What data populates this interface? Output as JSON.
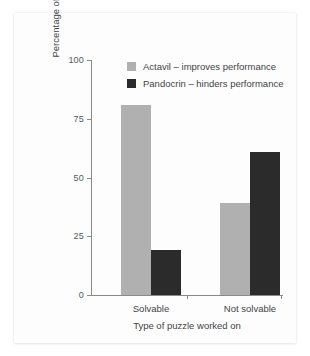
{
  "chart_data": {
    "type": "bar",
    "title": "",
    "subtitle": "",
    "xlabel": "Type of puzzle worked on",
    "ylabel": "Percentage of subjects choosing each drug",
    "categories": [
      "Solvable",
      "Not solvable"
    ],
    "series": [
      {
        "name": "Actavil – improves performance",
        "color": "#b0b0b0",
        "values": [
          81,
          39
        ]
      },
      {
        "name": "Pandocrin – hinders performance",
        "color": "#2b2b2b",
        "values": [
          19,
          61
        ]
      }
    ],
    "ylim": [
      0,
      100
    ],
    "yticks": [
      0,
      25,
      50,
      75,
      100
    ],
    "ytick_labels": [
      "0",
      "25",
      "50",
      "75",
      "100"
    ],
    "grid": false,
    "legend_position": "top-center",
    "axis_color": "#8a8a8a",
    "background": "#ffffff"
  },
  "legend": {
    "entries": [
      {
        "label": "Actavil – improves performance",
        "color": "#b0b0b0"
      },
      {
        "label": "Pandocrin – hinders performance",
        "color": "#2b2b2b"
      }
    ]
  },
  "axes": {
    "y_title": "Percentage of subjects choosing each drug",
    "x_title": "Type of puzzle worked on",
    "y_tick_labels": [
      "100",
      "75",
      "50",
      "25",
      "0"
    ],
    "x_tick_labels": [
      "Solvable",
      "Not solvable"
    ]
  }
}
